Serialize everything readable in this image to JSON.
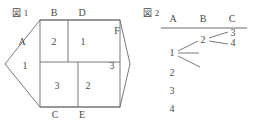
{
  "figure1": {
    "caption": "図 1",
    "edge_labels": [
      {
        "text": "A",
        "x": 22,
        "y": 42
      },
      {
        "text": "B",
        "x": 54,
        "y": 13
      },
      {
        "text": "D",
        "x": 82,
        "y": 13
      },
      {
        "text": "F",
        "x": 117,
        "y": 31
      },
      {
        "text": "C",
        "x": 55,
        "y": 115
      },
      {
        "text": "E",
        "x": 82,
        "y": 115
      }
    ],
    "region_numbers": [
      {
        "text": "1",
        "x": 25,
        "y": 66
      },
      {
        "text": "2",
        "x": 54,
        "y": 42
      },
      {
        "text": "1",
        "x": 83,
        "y": 42
      },
      {
        "text": "3",
        "x": 57,
        "y": 86
      },
      {
        "text": "2",
        "x": 88,
        "y": 86
      },
      {
        "text": "3",
        "x": 112,
        "y": 66
      }
    ],
    "hexagon_points": "5,64 40,20 120,20 130,64 120,107 40,107",
    "rect": {
      "x": 40,
      "y": 20,
      "width": 80,
      "height": 87
    },
    "divider_horizontal": {
      "x1": 40,
      "y1": 62,
      "x2": 120,
      "y2": 62
    },
    "divider_top_vertical": {
      "x1": 68,
      "y1": 20,
      "x2": 68,
      "y2": 62
    },
    "divider_bottom_vertical": {
      "x1": 78,
      "y1": 62,
      "x2": 78,
      "y2": 107
    }
  },
  "figure2": {
    "caption": "図 2",
    "column_headers": [
      {
        "text": "A",
        "x": 173,
        "y": 19
      },
      {
        "text": "B",
        "x": 203,
        "y": 19
      },
      {
        "text": "C",
        "x": 232,
        "y": 19
      }
    ],
    "header_rule": {
      "x1": 161,
      "y1": 28,
      "x2": 247,
      "y2": 28
    },
    "column_a_nodes": [
      {
        "text": "1",
        "x": 172,
        "y": 53
      },
      {
        "text": "2",
        "x": 172,
        "y": 73
      },
      {
        "text": "3",
        "x": 172,
        "y": 91
      },
      {
        "text": "4",
        "x": 172,
        "y": 109
      }
    ],
    "column_b_nodes": [
      {
        "text": "2",
        "x": 203,
        "y": 40
      }
    ],
    "column_c_nodes": [
      {
        "text": "3",
        "x": 233,
        "y": 33
      },
      {
        "text": "4",
        "x": 233,
        "y": 43
      }
    ],
    "branches_from_1": [
      {
        "x1": 178,
        "y1": 51,
        "x2": 198,
        "y2": 41
      },
      {
        "x1": 178,
        "y1": 53,
        "x2": 199,
        "y2": 53
      },
      {
        "x1": 178,
        "y1": 56,
        "x2": 200,
        "y2": 67
      }
    ],
    "branches_from_2": [
      {
        "x1": 209,
        "y1": 38,
        "x2": 228,
        "y2": 32
      },
      {
        "x1": 209,
        "y1": 41,
        "x2": 228,
        "y2": 44
      }
    ]
  }
}
